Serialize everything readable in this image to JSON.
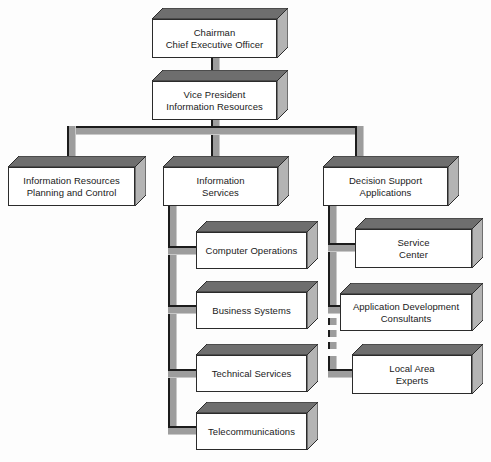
{
  "diagram": {
    "type": "organization-chart",
    "colors": {
      "box_front": "#ffffff",
      "box_top": "#6e6e6e",
      "box_side": "#b4b4b4",
      "outline": "#2b2b2b",
      "connector": "#9d9d9d",
      "connector_stroke": "#1c1c1c",
      "background": "#fdfdfd"
    },
    "nodes": {
      "chairman": "Chairman\nChief Executive Officer",
      "vice_president": "Vice President\nInformation Resources",
      "planning_control": "Information Resources\nPlanning and Control",
      "information_services": "Information\nServices",
      "decision_support": "Decision Support\nApplications",
      "computer_operations": "Computer Operations",
      "business_systems": "Business Systems",
      "technical_services": "Technical Services",
      "telecommunications": "Telecommunications",
      "service_center": "Service\nCenter",
      "app_dev_consultants": "Application Development\nConsultants",
      "local_area_experts": "Local Area\nExperts"
    }
  }
}
